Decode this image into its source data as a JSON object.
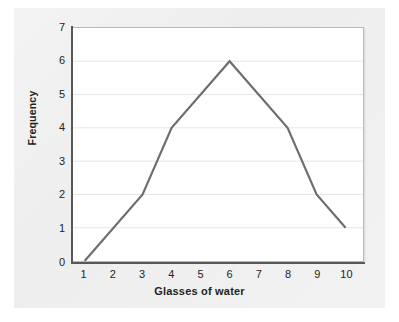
{
  "chart_data": {
    "type": "line",
    "title": "",
    "xlabel": "Glasses of water",
    "ylabel": "Frequency",
    "x": [
      1,
      3,
      4,
      6,
      8,
      9,
      10
    ],
    "values": [
      0,
      2,
      4,
      6,
      4,
      2,
      1
    ],
    "series": [
      {
        "name": "Frequency",
        "points": [
          {
            "x": 1,
            "y": 0
          },
          {
            "x": 3,
            "y": 2
          },
          {
            "x": 4,
            "y": 4
          },
          {
            "x": 6,
            "y": 6
          },
          {
            "x": 8,
            "y": 4
          },
          {
            "x": 9,
            "y": 2
          },
          {
            "x": 10,
            "y": 1
          }
        ]
      }
    ],
    "xlim": [
      0.6,
      10.6
    ],
    "ylim": [
      0,
      7
    ],
    "xticks": [
      "1",
      "2",
      "3",
      "4",
      "5",
      "6",
      "7",
      "8",
      "9",
      "10"
    ],
    "yticks": [
      "0",
      "1",
      "2",
      "3",
      "4",
      "5",
      "6",
      "7"
    ],
    "grid": "horizontal",
    "legend": "none",
    "line_color": "#6e6e6e",
    "grid_color": "#e6e6e6",
    "axis_color": "#585858",
    "plot_background": "#ffffff",
    "figure_background": "#f1f1f1",
    "text_color": "#231f20"
  }
}
